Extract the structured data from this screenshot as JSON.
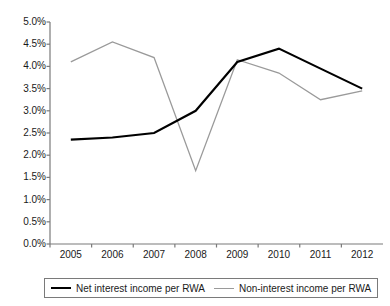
{
  "chart_data": {
    "type": "line",
    "title": "",
    "xlabel": "",
    "ylabel": "",
    "categories": [
      "2005",
      "2006",
      "2007",
      "2008",
      "2009",
      "2010",
      "2011",
      "2012"
    ],
    "series": [
      {
        "name": "Net interest income per RWA",
        "color": "#000000",
        "values": [
          2.35,
          2.4,
          2.5,
          3.0,
          4.1,
          4.4,
          3.95,
          3.5
        ]
      },
      {
        "name": "Non-interest income per RWA",
        "color": "#9a9a9a",
        "values": [
          4.1,
          4.55,
          4.2,
          1.65,
          4.15,
          3.85,
          3.25,
          3.45
        ]
      }
    ],
    "ylim": [
      0.0,
      5.0
    ],
    "ytick_values": [
      5.0,
      4.5,
      4.0,
      3.5,
      3.0,
      2.5,
      2.0,
      1.5,
      1.0,
      0.5,
      0.0
    ],
    "ytick_labels": [
      "5.0%",
      "4.5%",
      "4.0%",
      "3.5%",
      "3.0%",
      "2.5%",
      "2.0%",
      "1.5%",
      "1.0%",
      "0.5%",
      "0.0%"
    ],
    "grid": false,
    "legend_position": "bottom"
  },
  "legend": {
    "entries": [
      {
        "label": "Net interest income per RWA"
      },
      {
        "label": "Non-interest income per RWA"
      }
    ]
  },
  "axes": {
    "y_axis_name": "percent-of-RWA",
    "x_axis_name": "year"
  }
}
